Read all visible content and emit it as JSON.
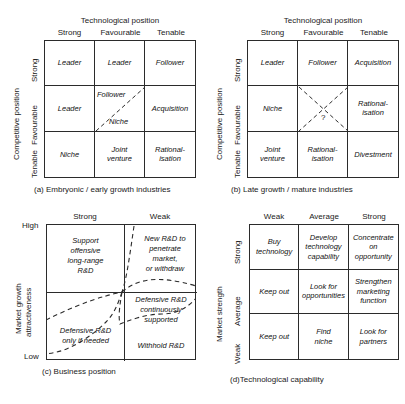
{
  "figure": {
    "panels": [
      {
        "id": "a",
        "caption": "(a) Embryonic / early growth industries",
        "x_axis_title": "Technological position",
        "y_axis_title": "Competitive position",
        "col_headers": [
          "Strong",
          "Favourable",
          "Tenable"
        ],
        "row_headers": [
          "Strong",
          "Favourable",
          "Tenable"
        ],
        "cells": [
          [
            "Leader",
            "Leader",
            "Follower"
          ],
          [
            "Leader",
            "",
            "Acquisition"
          ],
          [
            "Niche",
            "Joint\nventure",
            "Rational-\nisation"
          ]
        ],
        "split_cell": {
          "upper_label": "Follower",
          "lower_label": "Niche",
          "divider": "diagonal-dashed"
        }
      },
      {
        "id": "b",
        "caption": "(b) Late growth / mature industries",
        "x_axis_title": "Technological position",
        "y_axis_title": "Competitive position",
        "col_headers": [
          "Strong",
          "Favourable",
          "Tenable"
        ],
        "row_headers": [
          "Strong",
          "Favourable",
          "Tenable"
        ],
        "cells": [
          [
            "Leader",
            "Follower",
            "Acquisition"
          ],
          [
            "Niche",
            "?",
            "Rational-\nisation"
          ],
          [
            "Joint\nventure",
            "Rational-\nisation",
            "Divestment"
          ]
        ],
        "centre_cell": {
          "label": "?",
          "marking": "cross-dashed"
        }
      },
      {
        "id": "c",
        "caption": "(c) Business position",
        "x_axis_title": "",
        "y_axis_title": "Market growth\nattractiveness",
        "y_axis_title_line1": "Market growth",
        "y_axis_title_line2": "attractiveness",
        "col_headers": [
          "Strong",
          "Weak"
        ],
        "y_ticks": [
          "High",
          "Low"
        ],
        "regions": [
          "Support\noffensive\nlong-range\nR&D",
          "New R&D to\npenetrate\nmarket,\nor withdraw",
          "Defensive R&D\nonly if needed",
          "Defensive R&D\ncontinuously\nsupported",
          "Withhold R&D"
        ],
        "region_texts": {
          "top_left": [
            "Support",
            "offensive",
            "long-range",
            "R&D"
          ],
          "top_right": [
            "New R&D to",
            "penetrate",
            "market,",
            "or withdraw"
          ],
          "bottom_left": [
            "Defensive R&D",
            "only if needed"
          ],
          "middle_band": [
            "Defensive R&D",
            "continuously",
            "supported"
          ],
          "bottom_right": [
            "Withhold R&D"
          ]
        }
      },
      {
        "id": "d",
        "caption": "(d)Technological capability",
        "x_axis_title": "",
        "y_axis_title": "Market strength",
        "col_headers": [
          "Weak",
          "Average",
          "Strong"
        ],
        "row_headers": [
          "Strong",
          "Average",
          "Weak"
        ],
        "cells": [
          [
            "Buy\ntechnology",
            "Develop\ntechnology\ncapability",
            "Concentrate\non\nopportunity"
          ],
          [
            "Keep out",
            "Look for\nopportunities",
            "Strengthen\nmarketing\nfunction"
          ],
          [
            "Keep out",
            "Find\nniche",
            "Look for\npartners"
          ]
        ]
      }
    ]
  },
  "colors": {
    "line": "#2b2b2b",
    "text": "#111111",
    "background": "#ffffff"
  }
}
